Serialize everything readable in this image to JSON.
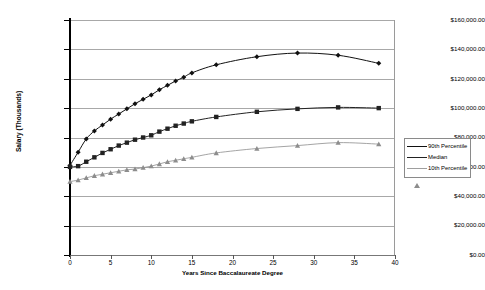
{
  "chart_data": {
    "type": "line",
    "title": "",
    "xlabel": "Years Since Baccalaureate Degree",
    "ylabel": "Salary (Thousands)",
    "xlim": [
      0,
      40
    ],
    "ylim": [
      0,
      160000
    ],
    "xticks": [
      0,
      5,
      10,
      15,
      20,
      25,
      30,
      35,
      40
    ],
    "xtick_labels": [
      "0",
      "5",
      "10",
      "15",
      "20",
      "25",
      "30",
      "35",
      "40"
    ],
    "yticks": [
      0,
      20000,
      40000,
      60000,
      80000,
      100000,
      120000,
      140000,
      160000
    ],
    "ytick_labels": [
      "$0.00",
      "$20,000.00",
      "$40,000.00",
      "$60,000.00",
      "$80,000.00",
      "$100,000.00",
      "$120,000.00",
      "$140,000.00",
      "$160,000.00"
    ],
    "grid": true,
    "legend_position": "right",
    "series": [
      {
        "name": "90th Percentile",
        "marker": "diamond",
        "color": "#111111",
        "x": [
          0,
          1,
          2,
          3,
          4,
          5,
          6,
          7,
          8,
          9,
          10,
          11,
          12,
          13,
          14,
          15,
          18,
          23,
          28,
          33,
          38
        ],
        "values": [
          61000,
          70000,
          79000,
          84500,
          88500,
          92500,
          96000,
          99500,
          103000,
          106000,
          109000,
          112500,
          115500,
          118500,
          121000,
          124000,
          129500,
          135000,
          137500,
          136000,
          130500
        ]
      },
      {
        "name": "Median",
        "marker": "square",
        "color": "#222222",
        "x": [
          0,
          1,
          2,
          3,
          4,
          5,
          6,
          7,
          8,
          9,
          10,
          11,
          12,
          13,
          14,
          15,
          18,
          23,
          28,
          33,
          38
        ],
        "values": [
          60000,
          60500,
          63500,
          66500,
          69500,
          72000,
          74500,
          76500,
          78500,
          80000,
          81500,
          84000,
          86000,
          88000,
          89500,
          91000,
          94000,
          97500,
          99500,
          100500,
          100000
        ]
      },
      {
        "name": "10th Percentile",
        "marker": "triangle",
        "color": "#8d8d8d",
        "x": [
          0,
          1,
          2,
          3,
          4,
          5,
          6,
          7,
          8,
          9,
          10,
          11,
          12,
          13,
          14,
          15,
          18,
          23,
          28,
          33,
          38
        ],
        "values": [
          50000,
          51000,
          52500,
          54000,
          55000,
          56000,
          57000,
          58000,
          58500,
          59500,
          60500,
          62000,
          63500,
          64500,
          65500,
          66500,
          69500,
          72500,
          74500,
          76500,
          75500
        ]
      }
    ]
  },
  "legend": {
    "items": [
      {
        "label": "90th Percentile"
      },
      {
        "label": "Median"
      },
      {
        "label": "10th Percentile"
      }
    ]
  }
}
